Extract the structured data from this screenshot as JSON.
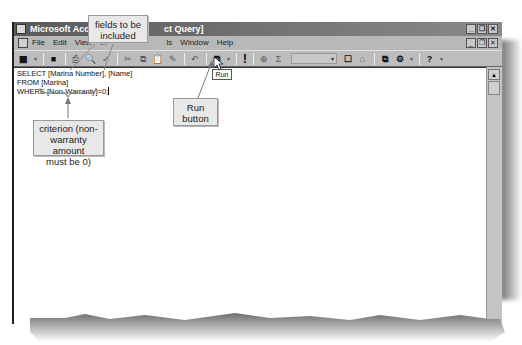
{
  "window": {
    "title": "Microsoft Access - [Marina Select Query]",
    "title_visible_left": "Microsoft Access -",
    "title_visible_right": "ct Query]",
    "controls": [
      "minimize",
      "restore",
      "close"
    ]
  },
  "menubar": {
    "items": [
      {
        "label": "File",
        "accel": "F"
      },
      {
        "label": "Edit",
        "accel": "E"
      },
      {
        "label": "View",
        "accel": "V"
      },
      {
        "label": "Insert",
        "accel": "I"
      },
      {
        "label": "Query",
        "accel": "Q"
      },
      {
        "label": "Tools",
        "accel": "T"
      },
      {
        "label": "Window",
        "accel": "W"
      },
      {
        "label": "Help",
        "accel": "H"
      }
    ],
    "visible": {
      "file": "File",
      "edit": "Edit",
      "view": "View",
      "in": "In",
      "ls": "ls",
      "window": "Window",
      "help": "Help"
    }
  },
  "toolbar": {
    "icons": {
      "view": "▦",
      "dropdown": "▾",
      "save": "■",
      "print": "⎙",
      "preview": "🔍",
      "spelling": "✓",
      "cut": "✂",
      "copy": "⧉",
      "paste": "📋",
      "format_painter": "✎",
      "undo": "↶",
      "query_type": "⧉",
      "run": "!",
      "show_table": "⊕",
      "totals": "Σ",
      "properties": "☐",
      "build": "⌂",
      "database_window": "⧉",
      "new_object": "⚙",
      "help": "?"
    },
    "top_values_combo": ""
  },
  "tooltip": {
    "text": "Run"
  },
  "editor": {
    "sql_lines": [
      "SELECT [Marina Number], [Name]",
      "FROM [Marina]",
      "WHERE [Non-Warranty]=0;"
    ]
  },
  "callouts": {
    "fields": "fields to be\nincluded",
    "fields_line1": "fields to be",
    "fields_line2": "included",
    "criterion_line1": "criterion (non-",
    "criterion_line2": "warranty amount",
    "criterion_line3": "must be 0)",
    "run_line1": "Run",
    "run_line2": "button"
  },
  "colors": {
    "titlebar": "#6a6a6a",
    "chrome": "#c0c0c0",
    "callout_bg": "#e8e8e8",
    "editor_bg": "#ffffff"
  }
}
